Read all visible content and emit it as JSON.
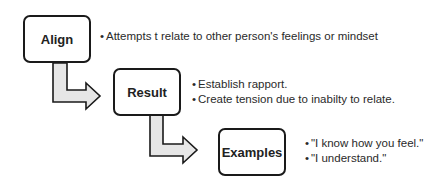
{
  "diagram": {
    "colors": {
      "box_border": "#1a1a1a",
      "arrow_fill": "#e6e6e6",
      "arrow_stroke": "#1a1a1a",
      "text": "#2a2a2a"
    },
    "steps": [
      {
        "label": "Align",
        "bullets": [
          "Attempts t relate to other person's feelings or mindset"
        ]
      },
      {
        "label": "Result",
        "bullets": [
          "Establish rapport.",
          "Create tension due to inabilty to relate."
        ]
      },
      {
        "label": "Examples",
        "bullets": [
          "\"I know how you feel.\"",
          "\"I understand.\""
        ]
      }
    ],
    "bullet_char": "•"
  }
}
